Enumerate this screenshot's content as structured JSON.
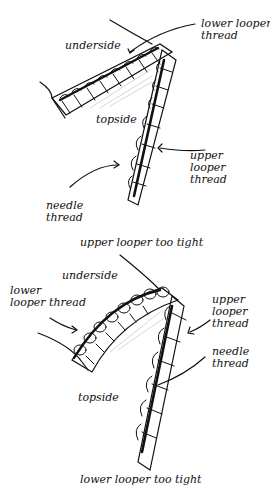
{
  "figure_top": {
    "labels": {
      "underside": "underside",
      "lower_looper_thread": [
        "lower looper",
        "thread"
      ],
      "topside": "topside",
      "upper_looper_thread": [
        "upper",
        "looper",
        "thread"
      ],
      "needle_thread": [
        "needle",
        "thread"
      ]
    },
    "caption": "upper looper too tight"
  },
  "figure_bottom": {
    "labels": {
      "underside": "underside",
      "lower_looper_thread": [
        "lower",
        "looper thread"
      ],
      "upper_looper_thread": [
        "upper",
        "looper",
        "thread"
      ],
      "needle_thread": [
        "needle",
        "thread"
      ],
      "topside": "topside"
    },
    "caption": "lower looper too tight"
  },
  "colors": {
    "ink": "#111111",
    "background": "#ffffff",
    "shade": "#bbbbbb"
  }
}
